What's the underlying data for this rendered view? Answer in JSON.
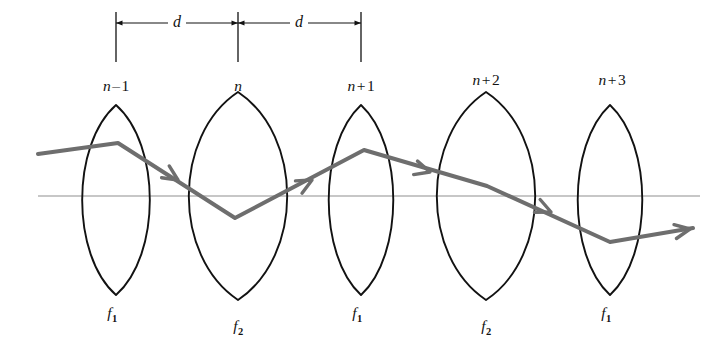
{
  "figure": {
    "kind": "ray-diagram",
    "width": 725,
    "height": 352,
    "background_color": "#ffffff",
    "ink_color": "#121212",
    "ray_color": "#6e6e6e",
    "axis_color": "#8f8f8f"
  },
  "dimensions": [
    {
      "label": "d",
      "x": 177,
      "y": 23
    },
    {
      "label": "d",
      "x": 299,
      "y": 23
    }
  ],
  "dimension_line": {
    "y": 23,
    "ticks_x": [
      116,
      238,
      361
    ],
    "extension_top": 12,
    "extension_bottom": 62
  },
  "optical_axis": {
    "x1": 38,
    "x2": 700,
    "y": 196
  },
  "lenses": [
    {
      "node_label": "n",
      "node_prefix": "n",
      "node_operator": "–",
      "node_number": "1",
      "node_label_full": "n – 1",
      "focal_label": "f",
      "focal_subscript": "1",
      "cx": 116,
      "cy": 200,
      "half_width": 22,
      "half_height": 95,
      "label_x": 116,
      "label_y": 78,
      "focal_x": 112,
      "focal_y": 305
    },
    {
      "node_label": "n",
      "node_prefix": "n",
      "node_operator": "",
      "node_number": "",
      "node_label_full": "n",
      "focal_label": "f",
      "focal_subscript": "2",
      "cx": 238,
      "cy": 196,
      "half_width": 32,
      "half_height": 104,
      "label_x": 238,
      "label_y": 78,
      "focal_x": 238,
      "focal_y": 318
    },
    {
      "node_label": "n",
      "node_prefix": "n",
      "node_operator": "+",
      "node_number": "1",
      "node_label_full": "n + 1",
      "focal_label": "f",
      "focal_subscript": "1",
      "cx": 361,
      "cy": 200,
      "half_width": 21,
      "half_height": 95,
      "label_x": 361,
      "label_y": 78,
      "focal_x": 357,
      "focal_y": 305
    },
    {
      "node_label": "n",
      "node_prefix": "n",
      "node_operator": "+",
      "node_number": "2",
      "node_label_full": "n + 2",
      "focal_label": "f",
      "focal_subscript": "2",
      "cx": 486,
      "cy": 196,
      "half_width": 32,
      "half_height": 104,
      "label_x": 486,
      "label_y": 72,
      "focal_x": 486,
      "focal_y": 318
    },
    {
      "node_label": "n",
      "node_prefix": "n",
      "node_operator": "+",
      "node_number": "3",
      "node_label_full": "n + 3",
      "focal_label": "f",
      "focal_subscript": "1",
      "cx": 610,
      "cy": 200,
      "half_width": 21,
      "half_height": 95,
      "label_x": 612,
      "label_y": 72,
      "focal_x": 606,
      "focal_y": 305
    }
  ],
  "ray": {
    "stroke_width": 4,
    "points": [
      {
        "x": 38,
        "y": 154
      },
      {
        "x": 118,
        "y": 143
      },
      {
        "x": 235,
        "y": 218
      },
      {
        "x": 364,
        "y": 150
      },
      {
        "x": 487,
        "y": 186
      },
      {
        "x": 610,
        "y": 242
      },
      {
        "x": 693,
        "y": 228
      }
    ],
    "arrowheads": [
      {
        "x": 178,
        "y": 180,
        "angle": 33
      },
      {
        "x": 312,
        "y": 180,
        "angle": -28
      },
      {
        "x": 430,
        "y": 172,
        "angle": 16
      },
      {
        "x": 551,
        "y": 212,
        "angle": 24
      },
      {
        "x": 690,
        "y": 229,
        "angle": -10
      }
    ]
  }
}
